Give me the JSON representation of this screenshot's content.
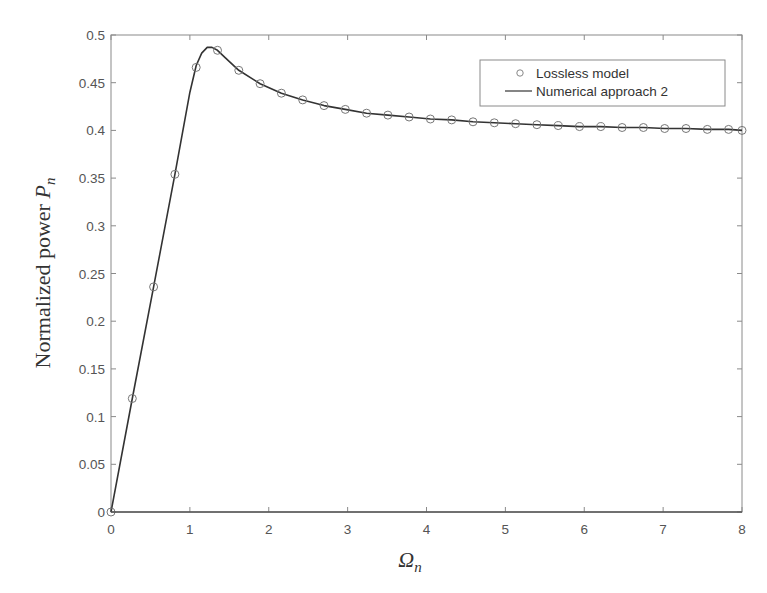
{
  "chart_data": {
    "type": "line",
    "title": "",
    "xlabel": "Ω_n",
    "ylabel": "Normalized power P_n",
    "xlim": [
      0,
      8
    ],
    "ylim": [
      0,
      0.5
    ],
    "grid": false,
    "legend_position": "upper right",
    "x_ticks": [
      0,
      1,
      2,
      3,
      4,
      5,
      6,
      7,
      8
    ],
    "x_tick_labels": [
      "0",
      "1",
      "2",
      "3",
      "4",
      "5",
      "6",
      "7",
      "8"
    ],
    "y_ticks": [
      0,
      0.05,
      0.1,
      0.15,
      0.2,
      0.25,
      0.3,
      0.35,
      0.4,
      0.45,
      0.5
    ],
    "y_tick_labels": [
      "0",
      "0.05",
      "0.1",
      "0.15",
      "0.2",
      "0.25",
      "0.3",
      "0.35",
      "0.4",
      "0.45",
      "0.5"
    ],
    "series": [
      {
        "name": "Lossless model",
        "style": "markers",
        "marker": "circle",
        "color": "#777777",
        "x": [
          0,
          0.27,
          0.54,
          0.81,
          1.08,
          1.35,
          1.62,
          1.89,
          2.16,
          2.43,
          2.7,
          2.97,
          3.24,
          3.51,
          3.78,
          4.05,
          4.32,
          4.59,
          4.86,
          5.13,
          5.4,
          5.67,
          5.94,
          6.21,
          6.48,
          6.75,
          7.02,
          7.29,
          7.56,
          7.83,
          8.0
        ],
        "y": [
          0,
          0.119,
          0.236,
          0.354,
          0.466,
          0.484,
          0.463,
          0.449,
          0.439,
          0.432,
          0.426,
          0.422,
          0.418,
          0.416,
          0.414,
          0.412,
          0.411,
          0.409,
          0.408,
          0.407,
          0.406,
          0.405,
          0.404,
          0.404,
          0.403,
          0.403,
          0.402,
          0.402,
          0.401,
          0.401,
          0.4
        ]
      },
      {
        "name": "Numerical approach 2",
        "style": "line",
        "color": "#333333",
        "x": [
          0,
          0.27,
          0.54,
          0.81,
          1.0,
          1.08,
          1.15,
          1.22,
          1.28,
          1.35,
          1.45,
          1.62,
          1.89,
          2.16,
          2.43,
          2.7,
          2.97,
          3.24,
          3.51,
          3.78,
          4.05,
          4.32,
          4.59,
          4.86,
          5.13,
          5.4,
          5.67,
          5.94,
          6.21,
          6.48,
          6.75,
          7.02,
          7.29,
          7.56,
          7.83,
          8.0
        ],
        "y": [
          0,
          0.119,
          0.236,
          0.354,
          0.44,
          0.468,
          0.481,
          0.487,
          0.487,
          0.484,
          0.476,
          0.463,
          0.449,
          0.439,
          0.432,
          0.426,
          0.422,
          0.418,
          0.416,
          0.414,
          0.412,
          0.411,
          0.409,
          0.408,
          0.407,
          0.406,
          0.405,
          0.404,
          0.404,
          0.403,
          0.403,
          0.402,
          0.402,
          0.401,
          0.401,
          0.4
        ]
      }
    ],
    "annotations": []
  },
  "axes": {
    "xlabel_main": "Ω",
    "xlabel_sub": "n",
    "ylabel_main": "Normalized power ",
    "ylabel_var": "P",
    "ylabel_sub": "n"
  },
  "legend": {
    "items": [
      {
        "label": "Lossless model",
        "icon": "circle-marker-icon"
      },
      {
        "label": "Numerical approach 2",
        "icon": "line-segment-icon"
      }
    ]
  }
}
